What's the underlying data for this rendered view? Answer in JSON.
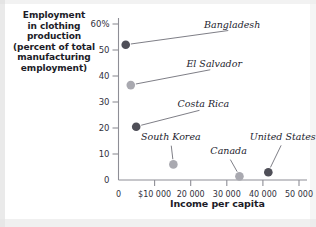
{
  "figure": {
    "y_axis_caption_lines": [
      "Employment",
      "in clothing",
      "production",
      "(percent of total",
      "manufacturing",
      "employment)"
    ],
    "x_axis_caption": "Income per capita"
  },
  "chart_data": {
    "type": "scatter",
    "title": "",
    "xlabel": "Income per capita",
    "ylabel": "Employment in clothing production (percent of total manufacturing employment)",
    "xlim": [
      0,
      55000
    ],
    "ylim": [
      0,
      62
    ],
    "grid": false,
    "legend": "none",
    "x_tick_labels": [
      "0",
      "$10 000",
      "20 000",
      "30 000",
      "40 000",
      "50 000"
    ],
    "x_tick_values": [
      0,
      10000,
      20000,
      30000,
      40000,
      50000
    ],
    "y_tick_labels": [
      "0",
      "10",
      "20",
      "30",
      "40",
      "50",
      "60%"
    ],
    "y_tick_values": [
      0,
      10,
      20,
      30,
      40,
      50,
      60
    ],
    "marker_colors": {
      "dark": "#4f4f58",
      "light": "#a9a9b0"
    },
    "points": [
      {
        "label": "Bangladesh",
        "x": 2000,
        "y": 52.0,
        "shade": "dark",
        "label_x": 31500,
        "label_y": 58.5
      },
      {
        "label": "El Salvador",
        "x": 3400,
        "y": 36.5,
        "shade": "light",
        "label_x": 26500,
        "label_y": 43.5
      },
      {
        "label": "Costa Rica",
        "x": 4900,
        "y": 20.5,
        "shade": "dark",
        "label_x": 23500,
        "label_y": 28.0
      },
      {
        "label": "South Korea",
        "x": 15200,
        "y": 6.0,
        "shade": "light",
        "label_x": 14500,
        "label_y": 15.5
      },
      {
        "label": "Canada",
        "x": 33500,
        "y": 1.4,
        "shade": "light",
        "label_x": 30500,
        "label_y": 10.0
      },
      {
        "label": "United States",
        "x": 41500,
        "y": 3.0,
        "shade": "dark",
        "label_x": 45500,
        "label_y": 15.5
      }
    ]
  }
}
